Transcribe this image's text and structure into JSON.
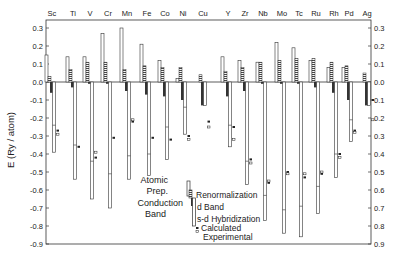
{
  "chart_data": {
    "type": "bar",
    "title": "",
    "ylabel": "E (Ry / atom)",
    "xlabel": "",
    "ylim": [
      -0.9,
      0.3
    ],
    "yticks": [
      0.3,
      0.2,
      0.1,
      0.0,
      -0.1,
      -0.2,
      -0.3,
      -0.4,
      -0.5,
      -0.6,
      -0.7,
      -0.8,
      -0.9
    ],
    "ytick_labels": [
      "0.3",
      "0.2",
      "0.1",
      "0.0",
      "-0.1",
      "-0.2",
      "-0.3",
      "-0.4",
      "-0.5",
      "-0.6",
      "-0.7",
      "-0.8",
      "-0.9"
    ],
    "categories": [
      "Sc",
      "Ti",
      "V",
      "Cr",
      "Mn",
      "Fe",
      "Co",
      "Ni",
      "Cu",
      "Y",
      "Zr",
      "Nb",
      "Mo",
      "Tc",
      "Ru",
      "Rh",
      "Pd",
      "Ag"
    ],
    "series": [
      {
        "name": "Atomic Prep.",
        "values": [
          0.15,
          0.14,
          0.14,
          0.27,
          0.3,
          0.21,
          0.12,
          0.02,
          0.0,
          0.14,
          0.12,
          0.11,
          0.22,
          0.19,
          0.12,
          0.08,
          0.08,
          0.0
        ]
      },
      {
        "name": "Renormalization",
        "values": [
          0.03,
          0.07,
          0.11,
          0.11,
          0.07,
          0.09,
          0.08,
          0.08,
          0.04,
          0.06,
          0.08,
          0.11,
          0.12,
          0.13,
          0.13,
          0.11,
          0.09,
          0.05
        ]
      },
      {
        "name": "d Band",
        "values": [
          -0.06,
          -0.03,
          -0.01,
          -0.01,
          -0.05,
          -0.07,
          -0.08,
          -0.1,
          -0.13,
          -0.08,
          -0.05,
          -0.01,
          -0.01,
          -0.01,
          -0.03,
          -0.06,
          -0.1,
          -0.13
        ]
      },
      {
        "name": "s-d Hybridization",
        "values": [
          -0.24,
          -0.35,
          -0.44,
          -0.51,
          -0.41,
          -0.4,
          -0.25,
          -0.14,
          0.0,
          -0.24,
          -0.44,
          -0.63,
          -0.71,
          -0.69,
          -0.58,
          -0.4,
          -0.21,
          0.0
        ]
      },
      {
        "name": "Conduction Band",
        "values": [
          -0.39,
          -0.54,
          -0.65,
          -0.7,
          -0.54,
          -0.52,
          -0.43,
          -0.29,
          -0.13,
          -0.36,
          -0.57,
          -0.77,
          -0.84,
          -0.86,
          -0.73,
          -0.53,
          -0.33,
          -0.13
        ]
      },
      {
        "name": "Calculated",
        "values": [
          -0.27,
          -0.36,
          -0.42,
          -0.31,
          -0.22,
          -0.31,
          -0.32,
          -0.3,
          -0.22,
          -0.25,
          -0.43,
          -0.56,
          -0.5,
          -0.53,
          -0.51,
          -0.4,
          -0.27,
          -0.1
        ]
      },
      {
        "name": "Experimental",
        "values": [
          -0.29,
          null,
          -0.39,
          null,
          -0.21,
          null,
          null,
          -0.32,
          -0.25,
          -0.32,
          -0.45,
          -0.55,
          -0.51,
          -0.51,
          -0.5,
          -0.42,
          -0.28,
          -0.21
        ]
      }
    ],
    "legend": {
      "position": "lower-center",
      "entries": [
        "Atomic Prep.",
        "Renormalization",
        "Conduction Band",
        "d Band",
        "s-d Hybridization",
        "Calculated",
        "Experimental"
      ]
    },
    "grid": false
  },
  "labels": {
    "ylabel": "E (Ry / atom)",
    "legend_atomic_prep_line1": "Atomic",
    "legend_atomic_prep_line2": "Prep.",
    "legend_conduction_line1": "Conduction",
    "legend_conduction_line2": "Band",
    "legend_renorm": "Renormalization",
    "legend_dband": "d Band",
    "legend_sd": "s-d Hybridization",
    "legend_calc": "Calculated",
    "legend_exp": "Experimental"
  },
  "colors": {
    "ink": "#222222",
    "background": "#ffffff",
    "dband_fill": "#333333"
  }
}
